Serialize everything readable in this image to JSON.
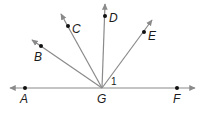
{
  "diagram": {
    "vertex": {
      "label": "G",
      "x": 102,
      "y": 88
    },
    "line": {
      "from": [
        10,
        88
      ],
      "to": [
        195,
        88
      ],
      "color": "#8a8a8a"
    },
    "points": [
      {
        "label": "A",
        "x": 25,
        "y": 88
      },
      {
        "label": "F",
        "x": 177,
        "y": 88
      },
      {
        "label": "B",
        "x": 41,
        "y": 46
      },
      {
        "label": "C",
        "x": 68,
        "y": 26
      },
      {
        "label": "D",
        "x": 105,
        "y": 16
      },
      {
        "label": "E",
        "x": 144,
        "y": 32
      }
    ],
    "rays": [
      {
        "name": "GB",
        "tip": [
          32,
          40
        ]
      },
      {
        "name": "GC",
        "tip": [
          61,
          14
        ]
      },
      {
        "name": "GD",
        "tip": [
          105,
          4
        ]
      },
      {
        "name": "GE",
        "tip": [
          152,
          20
        ]
      }
    ],
    "angle_label": "1",
    "labels": {
      "A": "A",
      "B": "B",
      "C": "C",
      "D": "D",
      "E": "E",
      "F": "F",
      "G": "G"
    }
  }
}
